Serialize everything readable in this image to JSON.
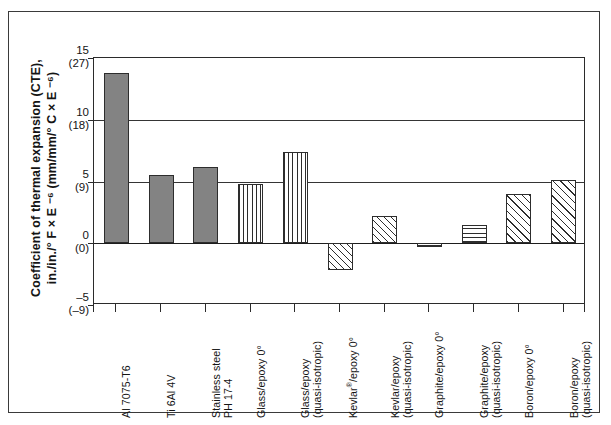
{
  "chart_data": {
    "type": "bar",
    "title": "",
    "ylabel_line1": "Coefficient of thermal expansion (CTE),",
    "ylabel_line2": "in./in./° F × E ⁻⁶ (mm/mm/° C × E ⁻⁶)",
    "xlabel": "",
    "ylim": [
      -5,
      15
    ],
    "grid": true,
    "legend": "none",
    "categories": [
      "Al 7075-T6",
      "Ti 6Al 4V",
      "Stainless steel PH 17-4",
      "Glass/epoxy 0°",
      "Glass/epoxy (quasi-isotropic)",
      "Kevlar®/epoxy 0°",
      "Kevlar/epoxy (quasi-isotropic)",
      "Graphite/epoxy 0°",
      "Graphite/epoxy (quasi-isotropic)",
      "Boron/epoxy 0°",
      "Boron/epoxy (quasi-isotropic)"
    ],
    "values": [
      13.8,
      5.5,
      6.2,
      4.8,
      7.4,
      -2.2,
      2.2,
      -0.3,
      1.5,
      4.0,
      5.1
    ],
    "yticks": [
      {
        "main": "15",
        "paren": "(27)",
        "value": 15
      },
      {
        "main": "10",
        "paren": "(18)",
        "value": 10
      },
      {
        "main": "5",
        "paren": "(9)",
        "value": 5
      },
      {
        "main": "0",
        "paren": "(0)",
        "value": 0
      },
      {
        "main": "–5",
        "paren": "(–9)",
        "value": -5
      }
    ],
    "bars": [
      {
        "label_line1": "Al 7075-T6",
        "label_line2": "",
        "value": 13.8,
        "pattern": "solid"
      },
      {
        "label_line1": "Ti 6Al 4V",
        "label_line2": "",
        "value": 5.5,
        "pattern": "solid"
      },
      {
        "label_line1": "Stainless steel",
        "label_line2": "PH 17-4",
        "value": 6.2,
        "pattern": "solid"
      },
      {
        "label_line1": "Glass/epoxy 0°",
        "label_line2": "",
        "value": 4.8,
        "pattern": "vertical"
      },
      {
        "label_line1": "Glass/epoxy",
        "label_line2": "(quasi-isotropic)",
        "value": 7.4,
        "pattern": "vertical"
      },
      {
        "label_line1": "Kevlar®/epoxy 0°",
        "label_line2": "",
        "value": -2.2,
        "pattern": "diagonal"
      },
      {
        "label_line1": "Kevlar/epoxy",
        "label_line2": "(quasi-isotropic)",
        "value": 2.2,
        "pattern": "diagonal"
      },
      {
        "label_line1": "Graphite/epoxy 0°",
        "label_line2": "",
        "value": -0.3,
        "pattern": "horizontal"
      },
      {
        "label_line1": "Graphite/epoxy",
        "label_line2": "(quasi-isotropic)",
        "value": 1.5,
        "pattern": "horizontal"
      },
      {
        "label_line1": "Boron/epoxy 0°",
        "label_line2": "",
        "value": 4.0,
        "pattern": "crosshatch"
      },
      {
        "label_line1": "Boron/epoxy",
        "label_line2": "(quasi-isotropic)",
        "value": 5.1,
        "pattern": "crosshatch"
      }
    ]
  },
  "colors": {
    "axis": "#2b2b2b",
    "solid_bar": "#838383",
    "hatch": "#2d2d2d",
    "background": "#ffffff",
    "frame": "#3a3a3a"
  }
}
